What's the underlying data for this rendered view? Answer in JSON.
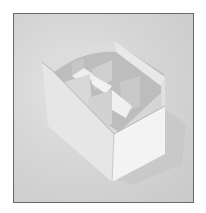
{
  "image": {
    "subject": "White paper box with internal cross dividers forming compartments",
    "description": "Photograph of a rectangular open paper/cardboard container with curved top rim and folded partition walls, on a light grey background, framed by a thin dark border",
    "colors": {
      "background": "#d4d4d4",
      "box_front": "#f0f0f0",
      "box_side": "#e2e2e2",
      "interior_shadow": "#b8b8b8",
      "divider_light": "#ececec",
      "divider_dark": "#c4c4c4",
      "frame": "#6a6a6a"
    }
  }
}
